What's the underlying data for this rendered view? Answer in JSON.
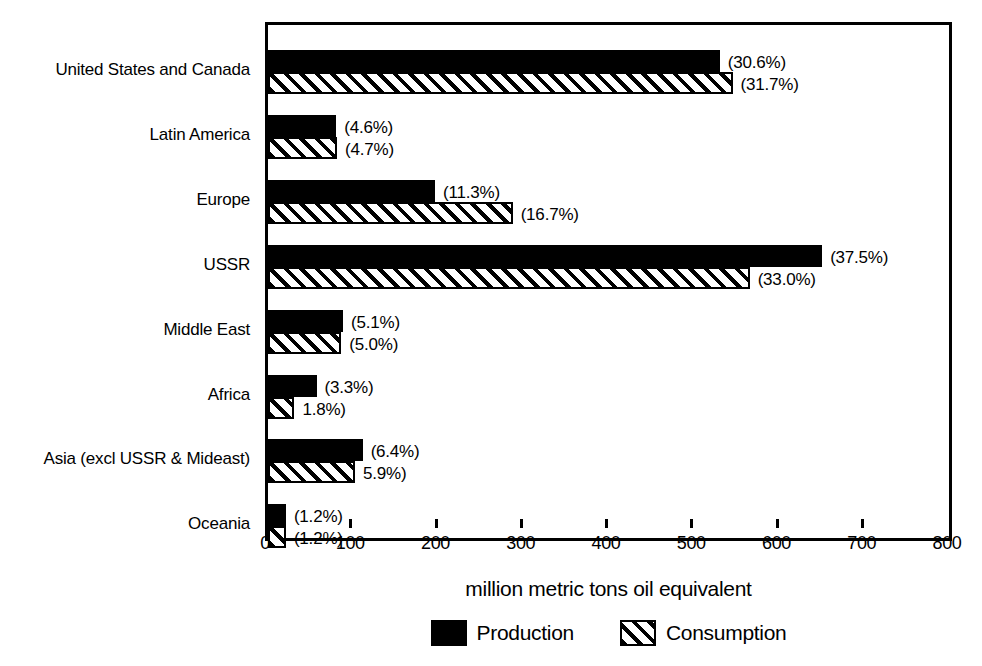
{
  "chart_data": {
    "type": "bar",
    "orientation": "horizontal",
    "title": "",
    "xlabel": "million metric tons oil equivalent",
    "ylabel": "",
    "xlim": [
      0,
      800
    ],
    "xticks": [
      0,
      100,
      200,
      300,
      400,
      500,
      600,
      700,
      800
    ],
    "xtick_labels": [
      "0",
      "100",
      "200",
      "300",
      "400",
      "500",
      "600",
      "700",
      "800"
    ],
    "grid": false,
    "legend_position": "bottom",
    "categories": [
      "United States and Canada",
      "Latin America",
      "Europe",
      "USSR",
      "Middle East",
      "Africa",
      "Asia (excl USSR & Mideast)",
      "Oceania"
    ],
    "series": [
      {
        "name": "Production",
        "fill": "solid-black",
        "values": [
          530,
          80,
          196,
          650,
          88,
          57,
          111,
          21
        ],
        "percent_labels": [
          "(30.6%)",
          "(4.6%)",
          "(11.3%)",
          "(37.5%)",
          "(5.1%)",
          "(3.3%)",
          "(6.4%)",
          "(1.2%)"
        ]
      },
      {
        "name": "Consumption",
        "fill": "diagonal-hatch",
        "values": [
          545,
          81,
          287,
          565,
          86,
          31,
          102,
          21
        ],
        "percent_labels": [
          "(31.7%)",
          "(4.7%)",
          "(16.7%)",
          "(33.0%)",
          "(5.0%)",
          "1.8%)",
          "5.9%)",
          "(1.2%)"
        ]
      }
    ]
  },
  "legend": {
    "items": [
      {
        "label": "Production",
        "swatch": "solid-black"
      },
      {
        "label": "Consumption",
        "swatch": "diagonal-hatch"
      }
    ]
  },
  "colors": {
    "production": "#000000",
    "consumption_fill": "#ffffff",
    "consumption_hatch": "#000000",
    "axis": "#000000",
    "background": "#ffffff"
  }
}
